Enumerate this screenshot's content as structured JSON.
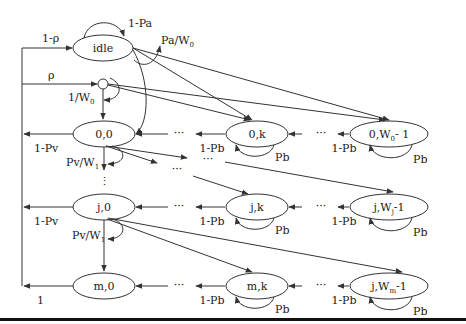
{
  "diagram": {
    "type": "markov-chain",
    "nodes": {
      "idle": "idle",
      "n00": "0,0",
      "n0k": "0,k",
      "n0W": "0,W",
      "n0W_sub": "0",
      "n0W_suffix": "- 1",
      "nj0": "j,0",
      "njk": "j,k",
      "njW": "j,W",
      "njW_sub": "j",
      "njW_suffix": "-1",
      "nm0": "m,0",
      "nmk": "m,k",
      "nmW": "j,W",
      "nmW_sub": "m",
      "nmW_suffix": "-1"
    },
    "labels": {
      "one_minus_pa": "1-Pa",
      "pa_w0": "Pa/W",
      "pa_w0_sub": "0",
      "one_minus_rho": "1-ρ",
      "rho": "ρ",
      "one_over_w0": "1/W",
      "one_over_w0_sub": "0",
      "one_minus_pv_0": "1-Pv",
      "pv_w1_0": "Pv/W",
      "pv_w1_0_sub": "1",
      "one_minus_pv_j": "1-Pv",
      "pv_w1_j": "Pv/W",
      "pv_w1_j_sub": "1",
      "one": "1",
      "one_minus_pb": "1-Pb",
      "pb": "Pb",
      "dots": "···",
      "vdots": "⋮"
    }
  }
}
